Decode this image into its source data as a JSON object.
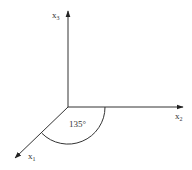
{
  "diagram": {
    "type": "3d-coordinate-axes",
    "axes": {
      "x1": {
        "label": "x",
        "subscript": "1",
        "direction": "down-left"
      },
      "x2": {
        "label": "x",
        "subscript": "2",
        "direction": "right"
      },
      "x3": {
        "label": "x",
        "subscript": "3",
        "direction": "up"
      }
    },
    "angle_annotation": {
      "value": "135°",
      "between": [
        "x1",
        "x2"
      ]
    },
    "colors": {
      "line": "#333333",
      "background": "#ffffff"
    }
  }
}
